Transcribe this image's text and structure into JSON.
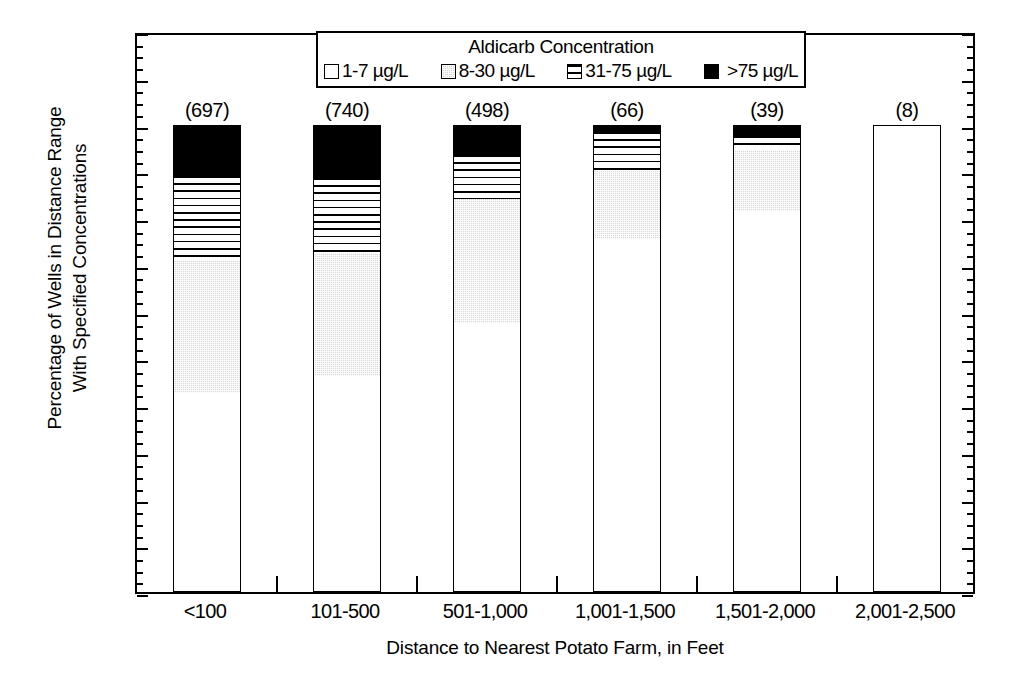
{
  "chart_data": {
    "type": "bar",
    "subtype": "stacked-vertical-100percent",
    "title": "",
    "xlabel": "Distance to Nearest Potato Farm, in Feet",
    "ylabel": "Percentage of Wells in Distance Range With Specified Concentrations",
    "ylabel_line1": "Percentage of Wells in Distance Range",
    "ylabel_line2": "With Specified Concentrations",
    "legend_title": "Aldicarb Concentration",
    "legend_position": "top-center-inside",
    "grid": false,
    "ylim": [
      0,
      120
    ],
    "yticks": [
      0,
      10,
      20,
      30,
      40,
      50,
      60,
      70,
      80,
      90,
      100,
      110,
      120
    ],
    "ytick_labels": [
      "0",
      "10",
      "20",
      "30",
      "40",
      "50",
      "60",
      "70",
      "80",
      "90",
      "100",
      "110",
      "120"
    ],
    "yminor_step": 2.5,
    "categories": [
      "<100",
      "101-500",
      "501-1,000",
      "1,001-1,500",
      "1,501-2,000",
      "2,001-2,500"
    ],
    "bar_labels": [
      "(697)",
      "(740)",
      "(498)",
      "(66)",
      "(39)",
      "(8)"
    ],
    "well_counts": [
      697,
      740,
      498,
      66,
      39,
      8
    ],
    "series": [
      {
        "name": "1-7 µg/L",
        "pattern": "white",
        "color": "#ffffff",
        "values": [
          42.5,
          46.3,
          57.5,
          75.5,
          81.5,
          100.0
        ]
      },
      {
        "name": "8-30 µg/L",
        "pattern": "stipple-gray",
        "color": "#d6d6d6",
        "values": [
          28.5,
          26.2,
          26.5,
          14.5,
          13.0,
          0.0
        ]
      },
      {
        "name": "31-75 µg/L",
        "pattern": "horizontal-lines",
        "color": "#ffffff",
        "values": [
          18.0,
          16.0,
          9.5,
          8.5,
          3.0,
          0.0
        ]
      },
      {
        "name": ">75 µg/L",
        "pattern": "solid-black",
        "color": "#000000",
        "values": [
          11.0,
          11.5,
          6.5,
          1.5,
          2.5,
          0.0
        ]
      }
    ],
    "cumulative_tops": [
      [
        42.5,
        71.0,
        89.0,
        100.0
      ],
      [
        46.3,
        72.5,
        88.5,
        100.0
      ],
      [
        57.5,
        84.0,
        93.5,
        100.0
      ],
      [
        75.5,
        90.0,
        98.5,
        100.0
      ],
      [
        81.5,
        94.5,
        97.5,
        100.0
      ],
      [
        100.0,
        100.0,
        100.0,
        100.0
      ]
    ]
  },
  "legend": {
    "title": "Aldicarb Concentration",
    "items": [
      {
        "label": "1-7 µg/L"
      },
      {
        "label": "8-30 µg/L"
      },
      {
        "label": "31-75 µg/L"
      },
      {
        "label": ">75 µg/L"
      }
    ]
  }
}
